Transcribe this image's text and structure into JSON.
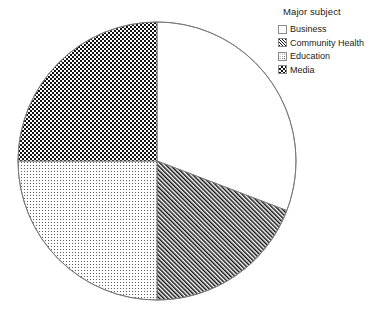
{
  "chart_data": {
    "type": "pie",
    "title": "",
    "legend_title": "Major subject",
    "legend_position": "right",
    "categories": [
      "Business",
      "Community Health",
      "Education",
      "Media"
    ],
    "values": [
      30.8,
      19.2,
      25.0,
      25.0
    ],
    "units": "percent",
    "start_angle_deg": 0,
    "direction": "clockwise",
    "slices": [
      {
        "label": "Business",
        "value": 30.8,
        "start_angle_deg": 0.0,
        "end_angle_deg": 110.9,
        "fill": "blank",
        "swatch_class": "sw-blank"
      },
      {
        "label": "Community Health",
        "value": 19.2,
        "start_angle_deg": 110.9,
        "end_angle_deg": 180.0,
        "fill": "diagonal-hatch",
        "swatch_class": "sw-diag"
      },
      {
        "label": "Education",
        "value": 25.0,
        "start_angle_deg": 180.0,
        "end_angle_deg": 270.0,
        "fill": "dots",
        "swatch_class": "sw-dots"
      },
      {
        "label": "Media",
        "value": 25.0,
        "start_angle_deg": 270.0,
        "end_angle_deg": 360.0,
        "fill": "checkerboard",
        "swatch_class": "sw-check"
      }
    ],
    "xlabel": "",
    "ylabel": "",
    "grid": false,
    "geometry": {
      "center_x": 157,
      "center_y": 161,
      "radius": 139
    },
    "colors": {
      "outline": "#777777",
      "ink": "#111111",
      "background": "#ffffff"
    }
  },
  "legend": {
    "title": "Major subject",
    "items": [
      {
        "label": "Business"
      },
      {
        "label": "Community Health"
      },
      {
        "label": "Education"
      },
      {
        "label": "Media"
      }
    ]
  }
}
